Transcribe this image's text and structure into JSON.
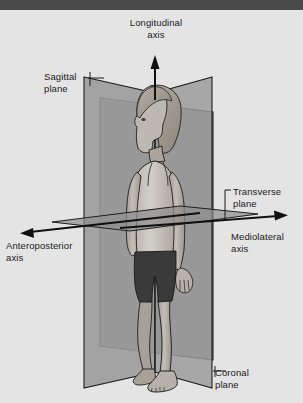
{
  "labels": {
    "longitudinal_axis": {
      "line1": "Longitudinal",
      "line2": "axis"
    },
    "sagittal_plane": {
      "line1": "Sagittal",
      "line2": "plane"
    },
    "transverse_plane": {
      "line1": "Transverse",
      "line2": "plane"
    },
    "mediolateral_axis": {
      "line1": "Mediolateral",
      "line2": "axis"
    },
    "anteroposterior_axis": {
      "line1": "Anteroposterior",
      "line2": "axis"
    },
    "coronal_plane": {
      "line1": "Coronal",
      "line2": "plane"
    }
  },
  "colors": {
    "background": "#e4e4e4",
    "top_band": "#4a4a4a",
    "plane_sagittal": "#9a9a9a",
    "plane_coronal": "#8c8c8c",
    "plane_transverse": "#8f8f8f",
    "outline": "#1f1f1f",
    "skin": "#b9b4ad",
    "skin_shadow": "#9a948d",
    "hair": "#a8a29a",
    "top_garment": "#c8c4bd",
    "shorts": "#3a3a3a",
    "label_text": "#1b1b1b"
  },
  "planes": [
    {
      "name": "sagittal",
      "orientation": "vertical-lateral",
      "label": "Sagittal plane"
    },
    {
      "name": "coronal",
      "orientation": "vertical-frontal",
      "label": "Coronal plane"
    },
    {
      "name": "transverse",
      "orientation": "horizontal",
      "label": "Transverse plane"
    }
  ],
  "axes": [
    {
      "name": "longitudinal",
      "direction": "vertical-up",
      "label": "Longitudinal axis"
    },
    {
      "name": "mediolateral",
      "direction": "horizontal-right",
      "label": "Mediolateral axis"
    },
    {
      "name": "anteroposterior",
      "direction": "horizontal-left",
      "label": "Anteroposterior axis"
    }
  ]
}
